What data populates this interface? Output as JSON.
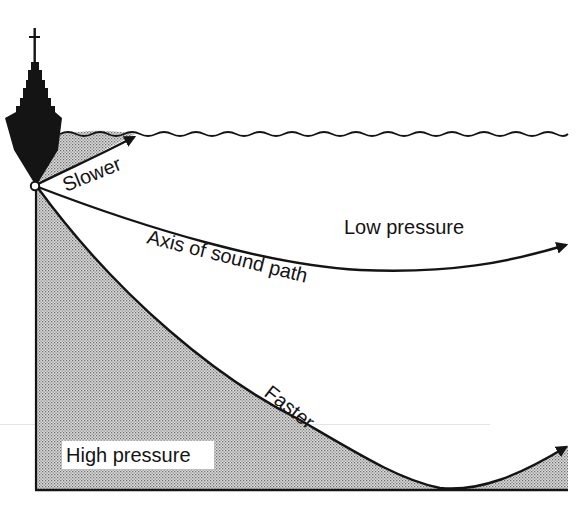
{
  "labels": {
    "slower": "Slower",
    "axis": "Axis of sound path",
    "low_pressure": "Low pressure",
    "faster": "Faster",
    "high_pressure": "High pressure"
  },
  "colors": {
    "ink": "#141414",
    "shade_dot": "#7a7a7a",
    "shade_bg": "#d8d8d8",
    "background": "#ffffff",
    "label_bg": "#ffffff"
  },
  "elements": {
    "ship": "ship-silhouette-icon",
    "source": "sound-source-point",
    "surface": "wavy-sea-surface",
    "seafloor": "sea-floor-line"
  }
}
